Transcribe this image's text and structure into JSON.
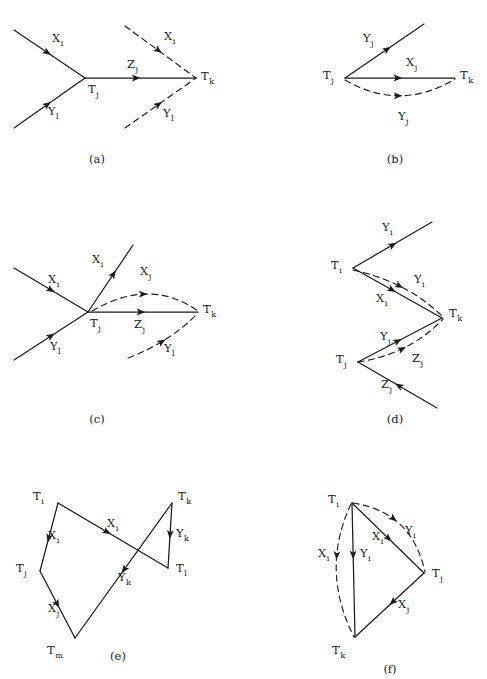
{
  "figure": {
    "background_color": "#ffffff",
    "ink_color": "#1b1b1b",
    "width": 487,
    "height": 679,
    "panels": [
      {
        "id": "a",
        "caption": "(a)",
        "caption_x": 97,
        "caption_y": 163,
        "vertices": [
          {
            "name": "T_j",
            "base": "T",
            "sub": "j",
            "x": 85,
            "y": 78,
            "label_x": 88,
            "label_y": 93
          },
          {
            "name": "T_k",
            "base": "T",
            "sub": "k",
            "x": 196,
            "y": 78,
            "label_x": 201,
            "label_y": 80
          }
        ],
        "edges": [
          {
            "name": "incoming-Xi",
            "style": "solid",
            "path": "M 14 30 L 85 78",
            "arrow_t": 0.52,
            "label": {
              "base": "X",
              "sub": "i",
              "x": 52,
              "y": 42
            }
          },
          {
            "name": "incoming-Yl",
            "style": "solid",
            "path": "M 14 128 L 85 78",
            "arrow_t": 0.52,
            "label": {
              "base": "Y",
              "sub": "l",
              "x": 48,
              "y": 115
            }
          },
          {
            "name": "propagator-Zj",
            "style": "solid",
            "path": "M 85 78 L 196 78",
            "arrow_t": 0.5,
            "label": {
              "base": "Z",
              "sub": "j",
              "x": 127,
              "y": 68
            }
          },
          {
            "name": "outgoing-Xi",
            "style": "dashed",
            "path": "M 125 26 L 196 78",
            "arrow_t": 0.52,
            "label": {
              "base": "X",
              "sub": "i",
              "x": 164,
              "y": 40
            }
          },
          {
            "name": "outgoing-Yl",
            "style": "dashed",
            "path": "M 125 128 L 196 78",
            "arrow_t": 0.52,
            "label": {
              "base": "Y",
              "sub": "l",
              "x": 163,
              "y": 117
            }
          }
        ]
      },
      {
        "id": "b",
        "caption": "(b)",
        "caption_x": 395,
        "caption_y": 163,
        "vertices": [
          {
            "name": "T_j",
            "base": "T",
            "sub": "j",
            "x": 345,
            "y": 78,
            "label_x": 323,
            "label_y": 79
          },
          {
            "name": "T_k",
            "base": "T",
            "sub": "k",
            "x": 455,
            "y": 78,
            "label_x": 460,
            "label_y": 79
          }
        ],
        "edges": [
          {
            "name": "incoming-Yj",
            "style": "solid",
            "path": "M 345 78 L 424 24",
            "arrow_t": 0.58,
            "label": {
              "base": "Y",
              "sub": "j",
              "x": 363,
              "y": 42
            }
          },
          {
            "name": "propagator-Xj",
            "style": "solid",
            "path": "M 345 78 L 455 78",
            "arrow_t": 0.52,
            "label": {
              "base": "X",
              "sub": "j",
              "x": 406,
              "y": 66
            }
          },
          {
            "name": "arc-Yj",
            "style": "dashed",
            "path": "M 345 80 Q 400 112 455 79",
            "arrow_t": 0.52,
            "label": {
              "base": "Y",
              "sub": "j",
              "x": 398,
              "y": 120
            }
          }
        ]
      },
      {
        "id": "c",
        "caption": "(c)",
        "caption_x": 97,
        "caption_y": 423,
        "vertices": [
          {
            "name": "T_j",
            "base": "T",
            "sub": "j",
            "x": 88,
            "y": 312,
            "label_x": 90,
            "label_y": 327
          },
          {
            "name": "T_k",
            "base": "T",
            "sub": "k",
            "x": 198,
            "y": 312,
            "label_x": 203,
            "label_y": 313
          }
        ],
        "edges": [
          {
            "name": "incoming-Xi",
            "style": "solid",
            "path": "M 14 268 L 88 312",
            "arrow_t": 0.55,
            "label": {
              "base": "X",
              "sub": "i",
              "x": 48,
              "y": 283
            }
          },
          {
            "name": "incoming-Yl",
            "style": "solid",
            "path": "M 14 360 L 88 312",
            "arrow_t": 0.55,
            "label": {
              "base": "Y",
              "sub": "l",
              "x": 50,
              "y": 350
            }
          },
          {
            "name": "outgoing-Xi",
            "style": "solid",
            "path": "M 88 312 L 133 245",
            "arrow_t": 0.62,
            "label": {
              "base": "X",
              "sub": "i",
              "x": 92,
              "y": 263
            }
          },
          {
            "name": "propagator-Zj",
            "style": "solid",
            "path": "M 88 312 L 198 312",
            "arrow_t": 0.52,
            "label": {
              "base": "Z",
              "sub": "j",
              "x": 134,
              "y": 328
            }
          },
          {
            "name": "arc-Xj",
            "style": "dashed",
            "path": "M 92 311 Q 150 277 198 311",
            "arrow_t": 0.52,
            "label": {
              "base": "X",
              "sub": "j",
              "x": 140,
              "y": 275
            }
          },
          {
            "name": "outgoing-Yl",
            "style": "dashed",
            "path": "M 128 358 Q 170 342 198 313",
            "arrow_t": 0.5,
            "label": {
              "base": "Y",
              "sub": "l",
              "x": 164,
              "y": 352
            }
          }
        ]
      },
      {
        "id": "d",
        "caption": "(d)",
        "caption_x": 395,
        "caption_y": 423,
        "vertices": [
          {
            "name": "T_i",
            "base": "T",
            "sub": "i",
            "x": 353,
            "y": 268,
            "label_x": 331,
            "label_y": 269
          },
          {
            "name": "T_k",
            "base": "T",
            "sub": "k",
            "x": 442,
            "y": 318,
            "label_x": 449,
            "label_y": 317
          },
          {
            "name": "T_j",
            "base": "T",
            "sub": "j",
            "x": 358,
            "y": 362,
            "label_x": 336,
            "label_y": 363
          }
        ],
        "edges": [
          {
            "name": "outgoing-Yi",
            "style": "solid",
            "path": "M 353 268 L 432 222",
            "arrow_t": 0.55,
            "label": {
              "base": "Y",
              "sub": "i",
              "x": 382,
              "y": 231
            }
          },
          {
            "name": "segment-Xi",
            "style": "solid",
            "path": "M 353 268 L 442 318",
            "arrow_t": 0.48,
            "label": {
              "base": "X",
              "sub": "i",
              "x": 376,
              "y": 302
            }
          },
          {
            "name": "arc-Yi",
            "style": "dashed",
            "path": "M 353 270 Q 408 282 443 317",
            "arrow_t": 0.52,
            "label": {
              "base": "Y",
              "sub": "i",
              "x": 414,
              "y": 283
            }
          },
          {
            "name": "segment-Yj",
            "style": "solid",
            "path": "M 358 362 L 442 318",
            "arrow_t": 0.52,
            "label": {
              "base": "Y",
              "sub": "j",
              "x": 380,
              "y": 340
            }
          },
          {
            "name": "arc-Zj",
            "style": "dashed",
            "path": "M 358 362 Q 410 354 443 319",
            "arrow_t": 0.52,
            "label": {
              "base": "Z",
              "sub": "j",
              "x": 412,
              "y": 362
            }
          },
          {
            "name": "incoming-Zj",
            "style": "solid",
            "path": "M 437 408 L 358 362",
            "arrow_t": 0.53,
            "label": {
              "base": "Z",
              "sub": "j",
              "x": 381,
              "y": 388
            }
          }
        ]
      },
      {
        "id": "e",
        "caption": "(e)",
        "caption_x": 118,
        "caption_y": 660,
        "vertices": [
          {
            "name": "T_i",
            "base": "T",
            "sub": "i",
            "x": 58,
            "y": 503,
            "label_x": 33,
            "label_y": 500
          },
          {
            "name": "T_j",
            "base": "T",
            "sub": "j",
            "x": 40,
            "y": 571,
            "label_x": 16,
            "label_y": 572
          },
          {
            "name": "T_m",
            "base": "T",
            "sub": "m",
            "x": 75,
            "y": 638,
            "label_x": 47,
            "label_y": 654
          },
          {
            "name": "T_k",
            "base": "T",
            "sub": "k",
            "x": 172,
            "y": 503,
            "label_x": 178,
            "label_y": 500
          },
          {
            "name": "T_l",
            "base": "T",
            "sub": "l",
            "x": 168,
            "y": 568,
            "label_x": 176,
            "label_y": 572
          }
        ],
        "edges": [
          {
            "name": "Ti-to-Tj-Xi",
            "style": "solid",
            "path": "M 58 503 L 40 571",
            "arrow_t": 0.58,
            "label": {
              "base": "X",
              "sub": "i",
              "x": 48,
              "y": 539
            }
          },
          {
            "name": "Tj-to-Tm-Xj",
            "style": "solid",
            "path": "M 40 571 L 75 638",
            "arrow_t": 0.55,
            "label": {
              "base": "X",
              "sub": "j",
              "x": 48,
              "y": 612
            }
          },
          {
            "name": "Ti-to-Tl-Xi",
            "style": "solid",
            "path": "M 58 503 L 168 568",
            "arrow_t": 0.48,
            "label": {
              "base": "X",
              "sub": "i",
              "x": 107,
              "y": 527
            }
          },
          {
            "name": "Tk-to-Tm-Yk",
            "style": "solid",
            "path": "M 172 503 L 75 638",
            "arrow_t": 0.52,
            "label": {
              "base": "Y",
              "sub": "k",
              "x": 118,
              "y": 581
            }
          },
          {
            "name": "Tk-to-Tl-Yk",
            "style": "solid",
            "path": "M 172 503 L 168 568",
            "arrow_t": 0.55,
            "label": {
              "base": "Y",
              "sub": "k",
              "x": 176,
              "y": 537
            }
          }
        ]
      },
      {
        "id": "f",
        "caption": "(f)",
        "caption_x": 390,
        "caption_y": 673,
        "vertices": [
          {
            "name": "T_i",
            "base": "T",
            "sub": "i",
            "x": 352,
            "y": 503,
            "label_x": 328,
            "label_y": 503
          },
          {
            "name": "T_j",
            "base": "T",
            "sub": "j",
            "x": 424,
            "y": 573,
            "label_x": 432,
            "label_y": 577
          },
          {
            "name": "T_k",
            "base": "T",
            "sub": "k",
            "x": 355,
            "y": 637,
            "label_x": 332,
            "label_y": 654
          }
        ],
        "edges": [
          {
            "name": "Ti-to-Tk-Yi",
            "style": "solid",
            "path": "M 352 503 L 355 637",
            "arrow_t": 0.42,
            "label": {
              "base": "Y",
              "sub": "i",
              "x": 360,
              "y": 557
            }
          },
          {
            "name": "Ti-to-Tj-Xi",
            "style": "solid",
            "path": "M 352 503 L 424 573",
            "arrow_t": 0.55,
            "label": {
              "base": "X",
              "sub": "i",
              "x": 372,
              "y": 540
            }
          },
          {
            "name": "Tj-to-Tk-Xj",
            "style": "solid",
            "path": "M 424 573 L 355 637",
            "arrow_t": 0.5,
            "label": {
              "base": "X",
              "sub": "j",
              "x": 398,
              "y": 608
            }
          },
          {
            "name": "arc-Yi-dashed",
            "style": "dashed",
            "path": "M 353 503 Q 412 512 425 572",
            "arrow_t": 0.45,
            "label": {
              "base": "Y",
              "sub": "i",
              "x": 405,
              "y": 534
            }
          },
          {
            "name": "arc-Xi-dashed",
            "style": "dashed",
            "path": "M 351 504 Q 320 570 354 637",
            "arrow_t": 0.42,
            "label": {
              "base": "X",
              "sub": "i",
              "x": 318,
              "y": 557
            }
          }
        ]
      }
    ]
  }
}
